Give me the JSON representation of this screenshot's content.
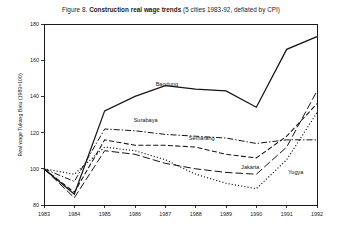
{
  "figure": {
    "title_prefix": "Figure 8. ",
    "title_main": "Construction real wage trends",
    "title_suffix": " (5 cities 1983-92, deflated by CPI)"
  },
  "chart_data": {
    "type": "line",
    "title": "Figure 8. Construction real wage trends (5 cities 1983-92, deflated by CPI)",
    "xlabel": "",
    "ylabel": "Real wage Tukang Batu (1983=100)",
    "x": [
      1983,
      1984,
      1985,
      1986,
      1987,
      1988,
      1989,
      1990,
      1991,
      1992
    ],
    "xtick_labels": [
      "1983",
      "1984",
      "1985",
      "1986",
      "1987",
      "1988",
      "1989",
      "1990",
      "1991",
      "1992"
    ],
    "ytick_labels": [
      "80",
      "100",
      "120",
      "140",
      "160",
      "180"
    ],
    "ytick_values": [
      80,
      100,
      120,
      140,
      160,
      180
    ],
    "ylim": [
      80,
      180
    ],
    "xlim": [
      1983,
      1992
    ],
    "grid": false,
    "legend": "inline-labels",
    "series": [
      {
        "name": "Bandung",
        "dash": "solid",
        "label_x": 1987.05,
        "label_y": 146,
        "values": [
          100,
          86,
          132,
          140,
          146,
          144,
          143,
          134,
          166,
          173
        ]
      },
      {
        "name": "Surabaya",
        "dash": "dashdot",
        "label_x": 1986.35,
        "label_y": 126,
        "values": [
          100,
          93,
          122,
          121,
          119,
          118,
          117,
          114,
          116,
          116
        ]
      },
      {
        "name": "Semarang",
        "dash": "dashed",
        "label_x": 1988.2,
        "label_y": 116,
        "values": [
          100,
          87,
          116,
          113,
          113,
          112,
          108,
          106,
          118,
          136
        ]
      },
      {
        "name": "Jakarta",
        "dash": "longdash",
        "label_x": 1989.8,
        "label_y": 100,
        "values": [
          100,
          84,
          110,
          108,
          103,
          100,
          98,
          97,
          112,
          143
        ]
      },
      {
        "name": "Yogya",
        "dash": "dotted",
        "label_x": 1991.3,
        "label_y": 97,
        "values": [
          100,
          97,
          112,
          110,
          105,
          97,
          92,
          89,
          105,
          131
        ]
      }
    ]
  }
}
